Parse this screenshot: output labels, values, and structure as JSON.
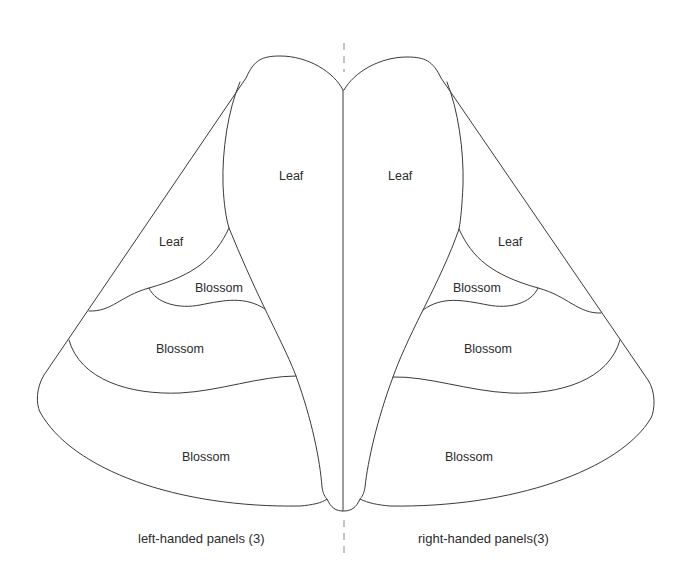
{
  "diagram": {
    "left": {
      "caption": "left-handed panels (3)",
      "regions": [
        {
          "id": "main-leaf",
          "label": "Leaf"
        },
        {
          "id": "side-leaf",
          "label": "Leaf"
        },
        {
          "id": "upper-blossom",
          "label": "Blossom"
        },
        {
          "id": "middle-blossom",
          "label": "Blossom"
        },
        {
          "id": "lower-blossom",
          "label": "Blossom"
        }
      ]
    },
    "right": {
      "caption": "right-handed panels(3)",
      "regions": [
        {
          "id": "main-leaf",
          "label": "Leaf"
        },
        {
          "id": "side-leaf",
          "label": "Leaf"
        },
        {
          "id": "upper-blossom",
          "label": "Blossom"
        },
        {
          "id": "middle-blossom",
          "label": "Blossom"
        },
        {
          "id": "lower-blossom",
          "label": "Blossom"
        }
      ]
    },
    "colors": {
      "stroke": "#3a3a3a",
      "center_dash": "#8a8a8a",
      "text": "#2b2b2b",
      "background": "#ffffff"
    }
  }
}
